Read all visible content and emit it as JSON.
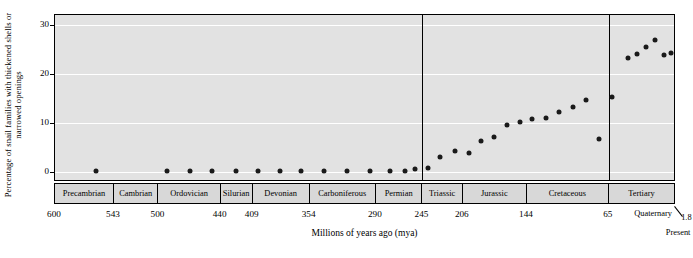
{
  "chart_data": {
    "type": "scatter",
    "title": "",
    "xlabel": "Millions of years ago (mya)",
    "ylabel": "Percentage of snail families with thickened shells or narrowed openings",
    "ylim": [
      -2,
      32
    ],
    "yticks": [
      "0",
      "10",
      "20",
      "30"
    ],
    "ytickvalues": [
      0,
      10,
      20,
      30
    ],
    "xlim": [
      600,
      0
    ],
    "xticks": [
      "600",
      "543",
      "500",
      "440",
      "409",
      "354",
      "290",
      "245",
      "206",
      "144",
      "65"
    ],
    "xtickvalues": [
      600,
      543,
      500,
      440,
      409,
      354,
      290,
      245,
      206,
      144,
      65
    ],
    "quaternary_label": "Quaternary",
    "quaternary_value": "1.8",
    "present_label": "Present",
    "grid": "horizontal-white",
    "periods": [
      {
        "name": "Precambrian",
        "start": 600,
        "end": 543
      },
      {
        "name": "Cambrian",
        "start": 543,
        "end": 500
      },
      {
        "name": "Ordovician",
        "start": 500,
        "end": 440
      },
      {
        "name": "Silurian",
        "start": 440,
        "end": 409
      },
      {
        "name": "Devonian",
        "start": 409,
        "end": 354
      },
      {
        "name": "Carboniferous",
        "start": 354,
        "end": 290
      },
      {
        "name": "Permian",
        "start": 290,
        "end": 245
      },
      {
        "name": "Triassic",
        "start": 245,
        "end": 206
      },
      {
        "name": "Jurassic",
        "start": 206,
        "end": 144
      },
      {
        "name": "Cretaceous",
        "start": 144,
        "end": 65
      },
      {
        "name": "Tertiary",
        "start": 65,
        "end": 1.8
      }
    ],
    "era_dividers": [
      245,
      65
    ],
    "points": [
      {
        "x": 560,
        "y": 0.2
      },
      {
        "x": 492,
        "y": 0.2
      },
      {
        "x": 470,
        "y": 0.2
      },
      {
        "x": 448,
        "y": 0.2
      },
      {
        "x": 425,
        "y": 0.2
      },
      {
        "x": 404,
        "y": 0.2
      },
      {
        "x": 383,
        "y": 0.2
      },
      {
        "x": 362,
        "y": 0.2
      },
      {
        "x": 340,
        "y": 0.2
      },
      {
        "x": 318,
        "y": 0.2
      },
      {
        "x": 296,
        "y": 0.2
      },
      {
        "x": 276,
        "y": 0.2
      },
      {
        "x": 262,
        "y": 0.2
      },
      {
        "x": 252,
        "y": 0.6
      },
      {
        "x": 240,
        "y": 0.8
      },
      {
        "x": 228,
        "y": 3.0
      },
      {
        "x": 214,
        "y": 4.4
      },
      {
        "x": 200,
        "y": 4.0
      },
      {
        "x": 188,
        "y": 6.4
      },
      {
        "x": 176,
        "y": 7.2
      },
      {
        "x": 163,
        "y": 9.6
      },
      {
        "x": 151,
        "y": 10.2
      },
      {
        "x": 139,
        "y": 10.8
      },
      {
        "x": 126,
        "y": 11.0
      },
      {
        "x": 113,
        "y": 12.2
      },
      {
        "x": 100,
        "y": 13.2
      },
      {
        "x": 87,
        "y": 14.6
      },
      {
        "x": 74,
        "y": 6.8
      },
      {
        "x": 62,
        "y": 15.4
      },
      {
        "x": 46,
        "y": 23.2
      },
      {
        "x": 38,
        "y": 24.0
      },
      {
        "x": 29,
        "y": 25.4
      },
      {
        "x": 20,
        "y": 27.0
      },
      {
        "x": 12,
        "y": 23.8
      },
      {
        "x": 5,
        "y": 24.2
      }
    ]
  }
}
